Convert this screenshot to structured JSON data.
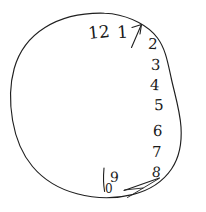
{
  "canvas": {
    "width": 206,
    "height": 212,
    "background_color": "#ffffff",
    "ink_color": "#1f1f1f",
    "description": "Hand-drawn clock face on white paper"
  },
  "clock_face": {
    "outline": {
      "shape": "irregular hand-drawn circle",
      "stroke_color": "#1f1f1f",
      "stroke_width": 1.1,
      "bounds": {
        "x": 10,
        "y": 12,
        "width": 170,
        "height": 186
      }
    },
    "numerals": [
      {
        "label": "12",
        "x": 88,
        "y": 24,
        "size": 17,
        "rotation": -6
      },
      {
        "label": "1",
        "x": 117,
        "y": 24,
        "size": 17,
        "rotation": -4
      },
      {
        "label": "2",
        "x": 148,
        "y": 37,
        "size": 15,
        "rotation": 4
      },
      {
        "label": "3",
        "x": 151,
        "y": 58,
        "size": 15,
        "rotation": 2
      },
      {
        "label": "4",
        "x": 150,
        "y": 78,
        "size": 15,
        "rotation": 3
      },
      {
        "label": "5",
        "x": 154,
        "y": 98,
        "size": 15,
        "rotation": -2
      },
      {
        "label": "6",
        "x": 153,
        "y": 124,
        "size": 15,
        "rotation": 2
      },
      {
        "label": "7",
        "x": 152,
        "y": 145,
        "size": 15,
        "rotation": 0
      },
      {
        "label": "8",
        "x": 152,
        "y": 165,
        "size": 14,
        "rotation": 8
      },
      {
        "label": "9",
        "x": 110,
        "y": 170,
        "size": 14,
        "rotation": 2
      },
      {
        "label": "0",
        "x": 105,
        "y": 183,
        "size": 12,
        "rotation": 0
      }
    ],
    "hands": [
      {
        "name": "hand-upper-right",
        "points_toward": "1",
        "stroke_color": "#1f1f1f"
      },
      {
        "name": "hand-lower-right",
        "points_toward": "between 8 and 9",
        "stroke_color": "#1f1f1f"
      }
    ],
    "stray_marks": [
      {
        "name": "vertical-stroke-left-of-nine"
      }
    ]
  }
}
